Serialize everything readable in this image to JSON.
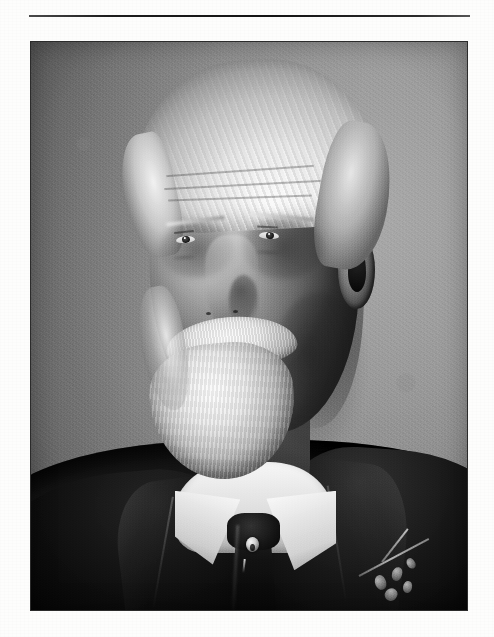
{
  "page": {
    "type": "scanned-book-page",
    "background_color": "#fdfdfc",
    "width": 494,
    "height": 637
  },
  "divider": {
    "name": "top-horizontal-rule",
    "color": "#1d1d1d",
    "x": 29,
    "y": 15,
    "width": 441,
    "height": 2
  },
  "photograph": {
    "kind": "black-and-white portrait photograph",
    "orientation": "portrait",
    "x": 31,
    "y": 42,
    "width": 436,
    "height": 568,
    "border_color": "#2b2b2b",
    "tones": {
      "background_light": "#a9a9a9",
      "background_mid": "#8b8b8b",
      "background_dark": "#5e5e5e",
      "highlight": "#f7f5f0",
      "shadow": "#101010",
      "skin_light": "#cdbba8",
      "skin_mid": "#8d7b69",
      "skin_dark": "#4d4238"
    },
    "subject": {
      "description": "Elderly gentleman, head-and-shoulders studio portrait, body turned slightly to his right, gaze directed off-camera to the viewer's left",
      "hair": "full white/silver hair swept back and to the side, visible strand texture",
      "facial_hair": "white moustache and full white chin beard (goatee); cheeks shaved",
      "face": "deeply lined forehead, heavy brows, deep-set eyes, prominent nose, right ear visible",
      "attire": "dark wool suit jacket with wide notched lapels, white starched wing collar shirt, dark four-in-hand necktie",
      "accessories": [
        {
          "name": "tie-stickpin",
          "description": "round light-coloured stickpin set in the necktie"
        },
        {
          "name": "boutonniere",
          "description": "small sprig with buds and leaves pinned to the left lapel (viewer's right)"
        }
      ],
      "lighting": "soft key light from the viewer's left; shadow side on the viewer's right; plain mottled grey studio backdrop with vignette"
    }
  }
}
